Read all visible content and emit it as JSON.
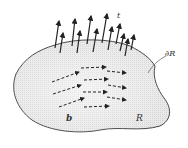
{
  "diagram": {
    "labels": {
      "traction": "t",
      "boundary": "∂R",
      "body_force": "b",
      "region": "R"
    },
    "colors": {
      "fill": "#e6e6e6",
      "outline": "#444444",
      "arrow": "#222222"
    },
    "traction_arrows": [
      {
        "x1": 55,
        "y1": 48,
        "x2": 59,
        "y2": 21
      },
      {
        "x1": 60,
        "y1": 53,
        "x2": 63,
        "y2": 33
      },
      {
        "x1": 72,
        "y1": 46,
        "x2": 75,
        "y2": 19
      },
      {
        "x1": 77,
        "y1": 53,
        "x2": 80,
        "y2": 31
      },
      {
        "x1": 87,
        "y1": 44,
        "x2": 91,
        "y2": 16
      },
      {
        "x1": 93,
        "y1": 52,
        "x2": 97,
        "y2": 29
      },
      {
        "x1": 102,
        "y1": 43,
        "x2": 107,
        "y2": 14
      },
      {
        "x1": 108,
        "y1": 50,
        "x2": 112,
        "y2": 27
      },
      {
        "x1": 116,
        "y1": 44,
        "x2": 120,
        "y2": 24
      },
      {
        "x1": 120,
        "y1": 51,
        "x2": 124,
        "y2": 34
      },
      {
        "x1": 125,
        "y1": 56,
        "x2": 128,
        "y2": 39
      },
      {
        "x1": 131,
        "y1": 50,
        "x2": 134,
        "y2": 35
      }
    ],
    "body_arrows": [
      {
        "x1": 52,
        "y1": 82,
        "x2": 79,
        "y2": 72
      },
      {
        "x1": 81,
        "y1": 68,
        "x2": 106,
        "y2": 67
      },
      {
        "x1": 107,
        "y1": 71,
        "x2": 126,
        "y2": 73
      },
      {
        "x1": 53,
        "y1": 94,
        "x2": 81,
        "y2": 85
      },
      {
        "x1": 84,
        "y1": 80,
        "x2": 108,
        "y2": 79
      },
      {
        "x1": 108,
        "y1": 85,
        "x2": 126,
        "y2": 88
      },
      {
        "x1": 83,
        "y1": 92,
        "x2": 107,
        "y2": 92
      },
      {
        "x1": 59,
        "y1": 107,
        "x2": 84,
        "y2": 98
      },
      {
        "x1": 107,
        "y1": 97,
        "x2": 126,
        "y2": 100
      },
      {
        "x1": 84,
        "y1": 107,
        "x2": 109,
        "y2": 106
      }
    ]
  }
}
